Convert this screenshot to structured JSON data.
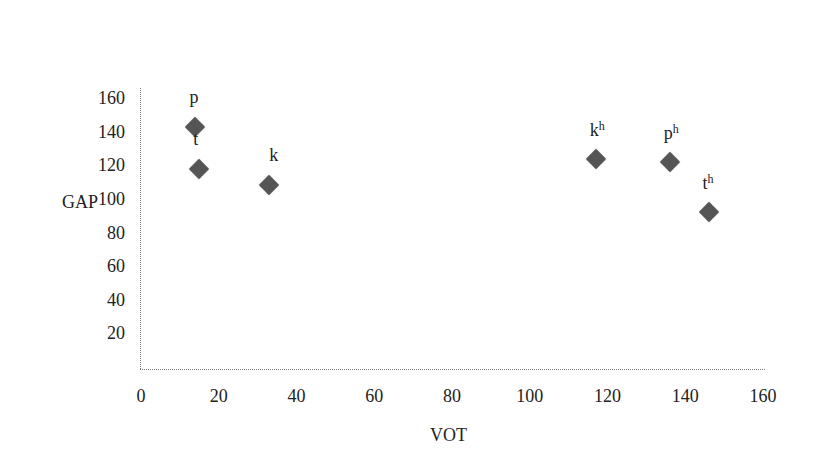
{
  "chart_data": {
    "type": "scatter",
    "title": "",
    "xlabel": "VOT",
    "ylabel": "GAP",
    "xlim": [
      0,
      160
    ],
    "ylim": [
      0,
      160
    ],
    "x_ticks": [
      "0",
      "20",
      "40",
      "60",
      "80",
      "100",
      "120",
      "140",
      "160"
    ],
    "y_ticks": [
      "20",
      "40",
      "60",
      "80",
      "100",
      "120",
      "140",
      "160"
    ],
    "grid": false,
    "legend": null,
    "points": [
      {
        "label": "p",
        "sup": "",
        "x": 14,
        "y": 143
      },
      {
        "label": "t",
        "sup": "",
        "x": 15,
        "y": 118
      },
      {
        "label": "k",
        "sup": "",
        "x": 33,
        "y": 108
      },
      {
        "label": "k",
        "sup": "h",
        "x": 117,
        "y": 124
      },
      {
        "label": "p",
        "sup": "h",
        "x": 136,
        "y": 122
      },
      {
        "label": "t",
        "sup": "h",
        "x": 146,
        "y": 92
      }
    ],
    "marker": "diamond",
    "marker_color": "#555555"
  }
}
